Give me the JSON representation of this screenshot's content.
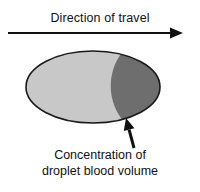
{
  "figure": {
    "background_color": "#ffffff",
    "title": "Direction of travel",
    "caption_line1": "Concentration of",
    "caption_line2": "droplet blood volume",
    "ink_color": "#111111"
  },
  "direction_arrow": {
    "name": "direction-of-travel-arrow",
    "orientation": "left-to-right",
    "x_start": 8,
    "x_end": 183,
    "y": 33,
    "line_width": 2.2,
    "head_length": 13,
    "head_width": 11,
    "color": "#111111"
  },
  "droplet": {
    "shape": "ellipse",
    "center_x": 93,
    "center_y": 87,
    "radius_x": 67,
    "radius_y": 36,
    "outline_color": "#1a1a1a",
    "outline_width": 1.6,
    "light_region_color": "#c8c8c8",
    "dark_region_color": "#6e6e6e",
    "boundary_description": "crescent arc bulging left, dark concentration on leading (right) edge",
    "boundary_top_x": 124,
    "boundary_mid_x": 106,
    "boundary_bottom_x": 126
  },
  "callout_arrow": {
    "name": "concentration-callout-arrow",
    "orientation": "points-up-left",
    "x_tail": 134,
    "y_tail": 148,
    "x_tip": 126,
    "y_tip": 118,
    "line_width": 3.0,
    "head_length": 12,
    "head_width": 11,
    "color": "#111111"
  },
  "chart_data": {
    "type": "diagram",
    "title": "Direction of travel",
    "annotations": [
      "Direction of travel",
      "Concentration of droplet blood volume"
    ],
    "regions": [
      {
        "label": "droplet body (trailing)",
        "fill": "#c8c8c8",
        "fraction": 0.62
      },
      {
        "label": "concentration of droplet blood volume (leading)",
        "fill": "#6e6e6e",
        "fraction": 0.38
      }
    ]
  }
}
